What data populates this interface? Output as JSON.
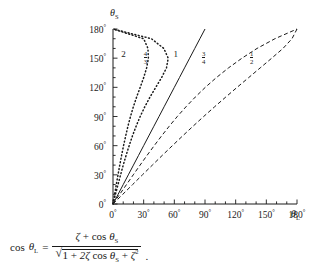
{
  "chart_data": {
    "type": "line",
    "title": "",
    "xlabel": "theta_L",
    "ylabel": "theta_S",
    "xlabel_display": "θ",
    "xlabel_sub": "L",
    "ylabel_display": "θ",
    "ylabel_sub": "S",
    "xlim": [
      0,
      180
    ],
    "ylim": [
      0,
      180
    ],
    "grid": false,
    "legend": "inline-curve-labels",
    "xticks": [
      0,
      30,
      60,
      90,
      120,
      150,
      180
    ],
    "yticks": [
      0,
      30,
      60,
      90,
      120,
      150,
      180
    ],
    "xticklabels": [
      "0",
      "30",
      "60",
      "90",
      "120",
      "150",
      "180"
    ],
    "yticklabels": [
      "0",
      "30",
      "60",
      "90",
      "120",
      "150",
      "180"
    ],
    "tick_suffix": "°",
    "minor_tick_step": 10,
    "series": [
      {
        "name": "zeta = 2",
        "label": "2",
        "label_type": "integer",
        "zeta": 2,
        "style": "dotted",
        "label_x": 11,
        "label_y": 152,
        "points": [
          [
            0,
            0
          ],
          [
            1.6,
            10
          ],
          [
            3.2,
            20
          ],
          [
            4.9,
            30
          ],
          [
            6.6,
            40
          ],
          [
            8.4,
            50
          ],
          [
            10.3,
            60
          ],
          [
            12.4,
            70
          ],
          [
            14.6,
            80
          ],
          [
            17.1,
            90
          ],
          [
            19.9,
            100
          ],
          [
            23.1,
            110
          ],
          [
            26.6,
            120
          ],
          [
            30.0,
            130
          ],
          [
            32.9,
            140
          ],
          [
            34.6,
            150
          ],
          [
            34.2,
            160
          ],
          [
            30.0,
            170
          ],
          [
            0,
            180
          ]
        ]
      },
      {
        "name": "zeta = 4/3",
        "label": "4/3",
        "label_type": "fraction",
        "label_num": "4",
        "label_den": "3",
        "zeta": 1.3333,
        "style": "dotted",
        "label_x": 33,
        "label_y": 152,
        "points": [
          [
            0,
            0
          ],
          [
            2.4,
            10
          ],
          [
            4.9,
            20
          ],
          [
            7.4,
            30
          ],
          [
            10.0,
            40
          ],
          [
            12.8,
            50
          ],
          [
            15.8,
            60
          ],
          [
            19.0,
            70
          ],
          [
            22.6,
            80
          ],
          [
            26.6,
            90
          ],
          [
            31.1,
            100
          ],
          [
            36.2,
            110
          ],
          [
            41.8,
            120
          ],
          [
            47.5,
            130
          ],
          [
            52.3,
            140
          ],
          [
            54.0,
            150
          ],
          [
            49.7,
            160
          ],
          [
            37.6,
            170
          ],
          [
            0,
            180
          ]
        ]
      },
      {
        "name": "zeta = 1",
        "label": "1",
        "label_type": "integer",
        "zeta": 1,
        "style": "solid",
        "label_x": 62,
        "label_y": 152,
        "points": [
          [
            0,
            0
          ],
          [
            5,
            10
          ],
          [
            10,
            20
          ],
          [
            15,
            30
          ],
          [
            20,
            40
          ],
          [
            25,
            50
          ],
          [
            30,
            60
          ],
          [
            35,
            70
          ],
          [
            40,
            80
          ],
          [
            45,
            90
          ],
          [
            50,
            100
          ],
          [
            55,
            110
          ],
          [
            60,
            120
          ],
          [
            65,
            130
          ],
          [
            70,
            140
          ],
          [
            75,
            150
          ],
          [
            80,
            160
          ],
          [
            85,
            170
          ],
          [
            90,
            180
          ]
        ]
      },
      {
        "name": "zeta = 3/4",
        "label": "3/4",
        "label_type": "fraction",
        "label_num": "3",
        "label_den": "4",
        "zeta": 0.75,
        "style": "dashed",
        "label_x": 90,
        "label_y": 152,
        "points": [
          [
            0,
            0
          ],
          [
            6.6,
            10
          ],
          [
            13.2,
            20
          ],
          [
            19.8,
            30
          ],
          [
            26.5,
            40
          ],
          [
            33.3,
            50
          ],
          [
            40.3,
            60
          ],
          [
            47.5,
            70
          ],
          [
            55.0,
            80
          ],
          [
            62.9,
            90
          ],
          [
            71.4,
            100
          ],
          [
            80.5,
            110
          ],
          [
            90.3,
            120
          ],
          [
            101.1,
            130
          ],
          [
            113.0,
            140
          ],
          [
            126.2,
            150
          ],
          [
            140.9,
            160
          ],
          [
            158.4,
            170
          ],
          [
            180,
            180
          ]
        ]
      },
      {
        "name": "zeta = 1/2",
        "label": "1/2",
        "label_type": "fraction",
        "label_num": "1",
        "label_den": "2",
        "zeta": 0.5,
        "style": "dashed",
        "label_x": 137,
        "label_y": 152,
        "points": [
          [
            0,
            0
          ],
          [
            9.6,
            10
          ],
          [
            19.2,
            20
          ],
          [
            28.8,
            30
          ],
          [
            38.5,
            40
          ],
          [
            48.2,
            50
          ],
          [
            58.1,
            60
          ],
          [
            68.1,
            70
          ],
          [
            78.3,
            80
          ],
          [
            88.7,
            90
          ],
          [
            99.4,
            100
          ],
          [
            110.3,
            110
          ],
          [
            121.4,
            120
          ],
          [
            132.7,
            130
          ],
          [
            144.0,
            140
          ],
          [
            155.3,
            150
          ],
          [
            166.3,
            160
          ],
          [
            175.1,
            170
          ],
          [
            180,
            180
          ]
        ]
      }
    ]
  },
  "equation": {
    "lhs_cos": "cos",
    "lhs_theta": "θ",
    "lhs_sub": "L",
    "equals": "=",
    "num_zeta": "ζ",
    "num_plus": "+",
    "num_cos": "cos",
    "num_theta": "θ",
    "num_sub": "S",
    "den_one": "1",
    "den_plus1": "+",
    "den_two_zeta": "2ζ",
    "den_cos": "cos",
    "den_theta": "θ",
    "den_sub": "S",
    "den_plus2": "+",
    "den_zeta2": "ζ",
    "den_exp": "2",
    "period": "."
  }
}
